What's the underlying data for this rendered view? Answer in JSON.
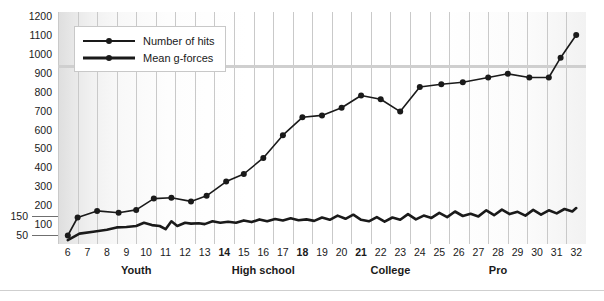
{
  "legend": {
    "items": [
      {
        "label": "Number of hits",
        "key": "hits"
      },
      {
        "label": "Mean g-forces",
        "key": "gforces"
      }
    ]
  },
  "axes": {
    "y_primary_ticks": [
      1200,
      1100,
      1000,
      900,
      800,
      700,
      600,
      500,
      400,
      300,
      200,
      100
    ],
    "y_secondary_ticks": [
      150,
      50
    ],
    "x_ticks": [
      6,
      7,
      8,
      9,
      10,
      11,
      12,
      13,
      14,
      15,
      16,
      17,
      18,
      19,
      20,
      21,
      22,
      23,
      24,
      25,
      26,
      27,
      28,
      29,
      30,
      31,
      32
    ],
    "x_bold_ticks": [
      14,
      18,
      21
    ],
    "x_groups": [
      {
        "label": "Youth",
        "center": 9.5
      },
      {
        "label": "High school",
        "center": 16.0
      },
      {
        "label": "College",
        "center": 22.5
      },
      {
        "label": "Pro",
        "center": 28.0
      }
    ]
  },
  "colors": {
    "line": "#1a1a1a",
    "gridline": "#c9c9c9",
    "text": "#1a1a1a",
    "legend_border": "#c8c8c8",
    "footer_rule": "#cfcfcf"
  },
  "chart_data": {
    "type": "line",
    "title": "",
    "xlabel": "",
    "ylabel": "",
    "xlim": [
      6,
      32
    ],
    "ylim_primary": [
      0,
      1200
    ],
    "ylim_secondary": [
      0,
      300
    ],
    "grid": "vertical",
    "legend_position": "top-left",
    "series": [
      {
        "name": "Number of hits",
        "axis": "primary",
        "x": [
          6.0,
          6.5,
          7.5,
          8.6,
          9.5,
          10.4,
          11.3,
          12.3,
          13.1,
          14.1,
          15.0,
          16.0,
          17.0,
          18.0,
          19.0,
          20.0,
          21.0,
          22.0,
          23.0,
          24.0,
          25.1,
          26.2,
          27.5,
          28.5,
          29.6,
          30.6,
          31.2,
          32.0
        ],
        "y": [
          45,
          140,
          175,
          165,
          180,
          240,
          245,
          225,
          255,
          330,
          370,
          455,
          575,
          670,
          680,
          720,
          785,
          765,
          700,
          830,
          845,
          855,
          880,
          900,
          880,
          880,
          985,
          1105
        ]
      },
      {
        "name": "Mean g-forces",
        "axis": "secondary",
        "x": [
          6.0,
          6.6,
          7.3,
          8.0,
          8.5,
          9.0,
          9.5,
          9.9,
          10.3,
          10.7,
          11.0,
          11.3,
          11.6,
          12.0,
          12.3,
          12.7,
          13.0,
          13.4,
          13.8,
          14.2,
          14.6,
          15.0,
          15.4,
          15.8,
          16.2,
          16.6,
          17.0,
          17.4,
          17.8,
          18.2,
          18.6,
          19.0,
          19.4,
          19.8,
          20.2,
          20.6,
          21.0,
          21.4,
          21.8,
          22.2,
          22.6,
          23.0,
          23.4,
          23.8,
          24.2,
          24.6,
          25.0,
          25.4,
          25.8,
          26.2,
          26.6,
          27.0,
          27.4,
          27.8,
          28.2,
          28.6,
          29.0,
          29.4,
          29.8,
          30.2,
          30.6,
          31.0,
          31.4,
          31.8,
          32.0
        ],
        "y": [
          20,
          55,
          65,
          75,
          88,
          90,
          95,
          112,
          100,
          95,
          78,
          120,
          95,
          112,
          108,
          110,
          105,
          120,
          112,
          118,
          112,
          125,
          116,
          130,
          120,
          132,
          124,
          136,
          126,
          130,
          122,
          140,
          128,
          150,
          133,
          155,
          128,
          120,
          142,
          118,
          140,
          128,
          158,
          130,
          150,
          138,
          165,
          142,
          172,
          148,
          160,
          146,
          178,
          152,
          182,
          158,
          170,
          150,
          180,
          155,
          178,
          162,
          185,
          172,
          190
        ]
      }
    ]
  }
}
